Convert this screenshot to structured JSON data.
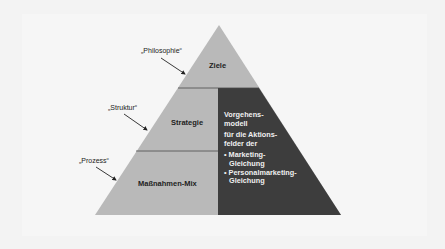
{
  "diagram": {
    "type": "pyramid",
    "colors": {
      "background": "#f3f3f3",
      "pyramid_light": "#b9b9b9",
      "pyramid_dark": "#3d3d3d",
      "divider": "#4a4a4a",
      "text_dark": "#222222",
      "text_light": "#f0f0f0"
    },
    "levels": [
      {
        "label": "Ziele",
        "annotation": "„Philosophie“"
      },
      {
        "label": "Strategie",
        "annotation": "„Struktur“"
      },
      {
        "label": "Maßnahmen-Mix",
        "annotation": "„Prozess“"
      }
    ],
    "side_panel": {
      "title_line1": "Vorgehens-",
      "title_line2": "modell",
      "sub_line1": "für die Aktions-",
      "sub_line2": "felder der",
      "bullet1_line1": "• Marketing-",
      "bullet1_line2": "Gleichung",
      "bullet2_line1": "• Personalmarketing-",
      "bullet2_line2": "Gleichung"
    }
  }
}
